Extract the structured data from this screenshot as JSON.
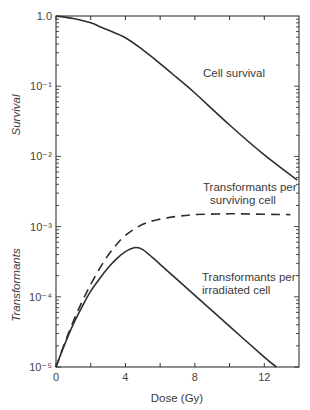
{
  "chart_data": {
    "type": "line",
    "title": "",
    "xlabel": "Dose (Gy)",
    "ylabel_upper": "Survival",
    "ylabel_lower": "Transformants",
    "xlim": [
      0,
      14
    ],
    "ylim": [
      1e-05,
      1.0
    ],
    "yscale": "log",
    "grid": false,
    "x_ticks": [
      0,
      4,
      8,
      12
    ],
    "x_minor_ticks": [
      2,
      6,
      10
    ],
    "x_tick_labels": [
      "0",
      "4",
      "8",
      "12"
    ],
    "y_ticks": [
      1.0,
      0.1,
      0.01,
      0.001,
      0.0001,
      1e-05
    ],
    "y_tick_labels": [
      "1.0",
      "10⁻¹",
      "10⁻²",
      "10⁻³",
      "10⁻⁴",
      "10⁻⁵"
    ],
    "series": [
      {
        "name": "Cell survival",
        "style": "solid",
        "x": [
          0,
          1,
          2,
          2.5,
          3,
          4,
          5,
          6,
          7,
          8,
          10,
          12,
          13.9
        ],
        "values": [
          1.0,
          0.92,
          0.8,
          0.71,
          0.63,
          0.49,
          0.33,
          0.21,
          0.13,
          0.08,
          0.028,
          0.0105,
          0.0046
        ]
      },
      {
        "name": "Transformants per surviving cell",
        "style": "dashed",
        "x": [
          0,
          0.5,
          1,
          1.5,
          2,
          2.5,
          3,
          3.5,
          4,
          5,
          6,
          7,
          8,
          10,
          12,
          13.5
        ],
        "values": [
          1e-05,
          2.2e-05,
          4.5e-05,
          8.5e-05,
          0.00015,
          0.00025,
          0.00039,
          0.00056,
          0.00075,
          0.00108,
          0.00128,
          0.0014,
          0.00148,
          0.00152,
          0.0015,
          0.00148
        ]
      },
      {
        "name": "Transformants per irradiated cell",
        "style": "solid",
        "x": [
          0,
          0.5,
          1,
          1.5,
          2,
          2.5,
          3,
          3.5,
          4,
          4.5,
          5,
          6,
          8,
          10,
          12,
          12.7
        ],
        "values": [
          1e-05,
          2.1e-05,
          4.1e-05,
          7.2e-05,
          0.00012,
          0.00018,
          0.00026,
          0.00035,
          0.00044,
          0.0005,
          0.00047,
          0.00029,
          0.000105,
          3.8e-05,
          1.38e-05,
          1e-05
        ]
      }
    ],
    "annotations": [
      {
        "text": "Cell survival",
        "x": 8.2,
        "y": 0.19
      },
      {
        "text": "Transformants per",
        "x": 7.7,
        "y": 0.0042
      },
      {
        "text": "surviving cell",
        "x": 8.3,
        "y": 0.0025
      },
      {
        "text": "Transformants per",
        "x": 7.7,
        "y": 0.00017
      },
      {
        "text": "irradiated cell",
        "x": 7.7,
        "y": 0.0001
      }
    ]
  },
  "labels": {
    "xlabel": "Dose (Gy)",
    "ylabel_upper": "Survival",
    "ylabel_lower": "Transformants",
    "annot_cell_survival": "Cell survival",
    "annot_surviving_1": "Transformants per",
    "annot_surviving_2": "surviving cell",
    "annot_irradiated_1": "Transformants per",
    "annot_irradiated_2": "irradiated cell"
  }
}
